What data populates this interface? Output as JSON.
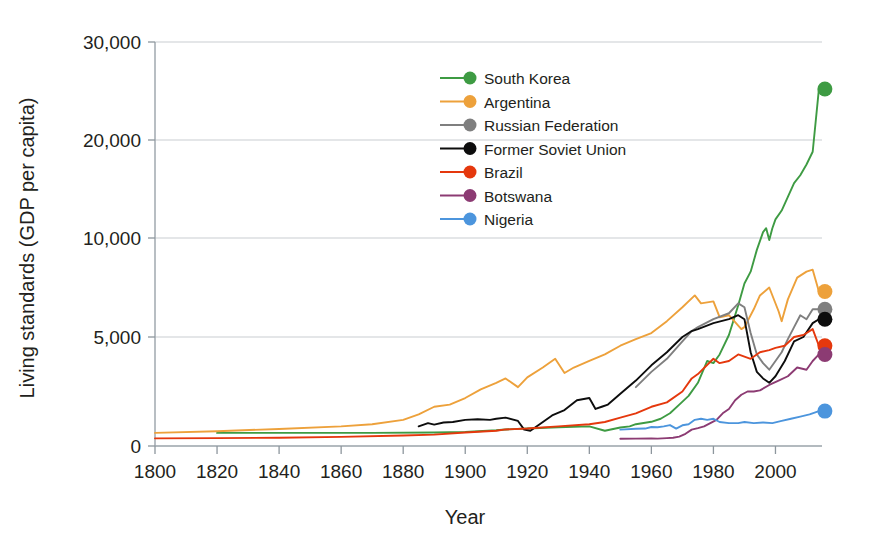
{
  "chart_data": {
    "type": "line",
    "title": "",
    "xlabel": "Year",
    "ylabel": "Living standards (GDP per capita)",
    "xlim": [
      1800,
      2015
    ],
    "ylim": [
      0,
      30000
    ],
    "grid": true,
    "legend_position": "inside-top-center",
    "xticks": [
      1800,
      1820,
      1840,
      1860,
      1880,
      1900,
      1920,
      1940,
      1960,
      1980,
      2000
    ],
    "xtick_labels": [
      "1800",
      "1820",
      "1840",
      "1860",
      "1880",
      "1900",
      "1920",
      "1940",
      "1960",
      "1980",
      "2000"
    ],
    "yticks": [
      0,
      5000,
      10000,
      20000,
      30000
    ],
    "ytick_labels": [
      "0",
      "5,000",
      "10,000",
      "20,000",
      "30,000"
    ],
    "endpoint_markers": true,
    "series": [
      {
        "name": "South Korea",
        "color": "#3e9b43",
        "x": [
          1820,
          1850,
          1870,
          1890,
          1900,
          1910,
          1913,
          1920,
          1930,
          1940,
          1945,
          1950,
          1953,
          1955,
          1960,
          1963,
          1966,
          1969,
          1972,
          1975,
          1978,
          1980,
          1982,
          1985,
          1988,
          1990,
          1992,
          1994,
          1996,
          1997,
          1998,
          1999,
          2000,
          2002,
          2004,
          2006,
          2008,
          2010,
          2012,
          2014
        ],
        "y": [
          600,
          600,
          604,
          620,
          640,
          720,
          760,
          800,
          860,
          900,
          700,
          850,
          900,
          1000,
          1110,
          1250,
          1500,
          1900,
          2300,
          2900,
          3900,
          3800,
          4200,
          5100,
          6600,
          7700,
          8300,
          9400,
          10600,
          11000,
          9900,
          11000,
          11900,
          12800,
          14200,
          15600,
          16400,
          17500,
          18800,
          25200
        ]
      },
      {
        "name": "Argentina",
        "color": "#eda13b",
        "x": [
          1800,
          1820,
          1840,
          1860,
          1870,
          1880,
          1885,
          1890,
          1895,
          1900,
          1905,
          1910,
          1913,
          1917,
          1920,
          1925,
          1929,
          1932,
          1935,
          1940,
          1945,
          1950,
          1955,
          1960,
          1965,
          1970,
          1974,
          1976,
          1980,
          1982,
          1985,
          1989,
          1990,
          1993,
          1995,
          1998,
          2001,
          2002,
          2004,
          2007,
          2010,
          2012,
          2014
        ],
        "y": [
          600,
          680,
          780,
          900,
          1000,
          1200,
          1450,
          1800,
          1900,
          2200,
          2600,
          2900,
          3100,
          2700,
          3150,
          3600,
          4000,
          3350,
          3600,
          3900,
          4200,
          4600,
          4900,
          5200,
          5800,
          6500,
          7100,
          6700,
          6800,
          6000,
          6100,
          5400,
          5500,
          6400,
          7100,
          7500,
          6300,
          5800,
          6900,
          8000,
          8300,
          8400,
          7300
        ]
      },
      {
        "name": "Russian Federation",
        "color": "#7f7f7f",
        "x": [
          1955,
          1960,
          1965,
          1970,
          1973,
          1975,
          1980,
          1985,
          1988,
          1990,
          1992,
          1994,
          1996,
          1998,
          2000,
          2002,
          2004,
          2006,
          2008,
          2010,
          2012,
          2014
        ],
        "y": [
          2700,
          3400,
          4000,
          4800,
          5300,
          5500,
          5900,
          6200,
          6700,
          6500,
          5200,
          4200,
          3800,
          3500,
          3900,
          4300,
          4900,
          5500,
          6100,
          5900,
          6400,
          6400
        ]
      },
      {
        "name": "Former Soviet Union",
        "color": "#0d0d0d",
        "x": [
          1885,
          1888,
          1890,
          1893,
          1896,
          1900,
          1904,
          1908,
          1910,
          1913,
          1917,
          1919,
          1921,
          1924,
          1928,
          1932,
          1936,
          1940,
          1942,
          1944,
          1946,
          1950,
          1955,
          1960,
          1965,
          1970,
          1973,
          1975,
          1980,
          1985,
          1988,
          1990,
          1992,
          1994,
          1996,
          1998,
          2000,
          2003,
          2006,
          2009,
          2012,
          2014
        ],
        "y": [
          900,
          1050,
          980,
          1080,
          1100,
          1200,
          1230,
          1200,
          1250,
          1300,
          1150,
          750,
          700,
          1000,
          1400,
          1650,
          2100,
          2200,
          1700,
          1800,
          1900,
          2400,
          3000,
          3700,
          4300,
          5000,
          5300,
          5400,
          5700,
          5900,
          6100,
          5900,
          4300,
          3400,
          3100,
          2900,
          3200,
          3900,
          4800,
          5000,
          5700,
          5900
        ]
      },
      {
        "name": "Brazil",
        "color": "#e5380d",
        "x": [
          1800,
          1820,
          1840,
          1860,
          1880,
          1890,
          1900,
          1910,
          1913,
          1920,
          1930,
          1940,
          1945,
          1950,
          1955,
          1960,
          1965,
          1970,
          1973,
          1975,
          1980,
          1982,
          1985,
          1988,
          1990,
          1992,
          1995,
          1998,
          2000,
          2003,
          2006,
          2009,
          2012,
          2014
        ],
        "y": [
          350,
          360,
          380,
          420,
          480,
          520,
          620,
          700,
          760,
          800,
          900,
          1000,
          1100,
          1300,
          1500,
          1800,
          2000,
          2500,
          3100,
          3300,
          4000,
          3800,
          3900,
          4200,
          4100,
          4000,
          4300,
          4400,
          4500,
          4600,
          5000,
          5100,
          5400,
          4600
        ]
      },
      {
        "name": "Botswana",
        "color": "#8c3b73",
        "x": [
          1950,
          1955,
          1960,
          1962,
          1965,
          1967,
          1969,
          1971,
          1973,
          1975,
          1977,
          1979,
          1981,
          1983,
          1985,
          1987,
          1989,
          1991,
          1993,
          1995,
          1998,
          2001,
          2004,
          2007,
          2010,
          2012,
          2014
        ],
        "y": [
          330,
          340,
          350,
          340,
          360,
          380,
          430,
          560,
          750,
          820,
          900,
          1050,
          1200,
          1500,
          1700,
          2100,
          2350,
          2500,
          2500,
          2550,
          2800,
          3000,
          3200,
          3600,
          3500,
          3900,
          4200
        ]
      },
      {
        "name": "Nigeria",
        "color": "#4c95dd",
        "x": [
          1950,
          1955,
          1958,
          1960,
          1962,
          1964,
          1966,
          1968,
          1970,
          1972,
          1974,
          1976,
          1978,
          1980,
          1982,
          1985,
          1988,
          1990,
          1993,
          1996,
          1999,
          2002,
          2005,
          2008,
          2011,
          2014
        ],
        "y": [
          750,
          790,
          800,
          870,
          860,
          900,
          960,
          800,
          950,
          1000,
          1200,
          1250,
          1200,
          1250,
          1100,
          1050,
          1050,
          1100,
          1050,
          1080,
          1050,
          1150,
          1250,
          1350,
          1450,
          1600
        ]
      }
    ]
  },
  "axes": {
    "x_title": "Year",
    "y_title": "Living standards (GDP per capita)"
  },
  "legend": {
    "items": [
      {
        "label": "South Korea",
        "color": "#3e9b43"
      },
      {
        "label": "Argentina",
        "color": "#eda13b"
      },
      {
        "label": "Russian Federation",
        "color": "#7f7f7f"
      },
      {
        "label": "Former Soviet Union",
        "color": "#0d0d0d"
      },
      {
        "label": "Brazil",
        "color": "#e5380d"
      },
      {
        "label": "Botswana",
        "color": "#8c3b73"
      },
      {
        "label": "Nigeria",
        "color": "#4c95dd"
      }
    ]
  }
}
